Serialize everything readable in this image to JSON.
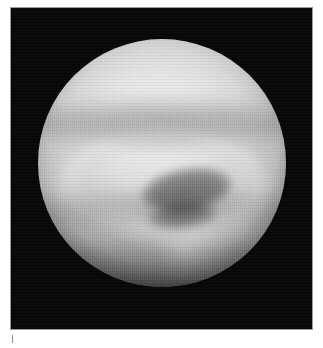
{
  "figure": {
    "name": "planetary-disc-photographic-plate",
    "media_type": "grayscale-astronomical-photograph",
    "frame": {
      "border_color": "#9a9a9a",
      "background_color": "#050505"
    },
    "subject": {
      "label": "planetary disc",
      "disc_center_x": 162,
      "disc_center_y": 163,
      "disc_radius": 124,
      "features": [
        {
          "name": "bright-polar-cap",
          "position": "upper hemisphere"
        },
        {
          "name": "dark-band-upper",
          "position": "upper-middle latitude"
        },
        {
          "name": "dark-spot-primary",
          "position": "central",
          "shape": "ellipse"
        },
        {
          "name": "dark-spot-secondary",
          "position": "below central spot",
          "shape": "ellipse"
        },
        {
          "name": "bright-chevron",
          "position": "lower hemisphere",
          "shape": "v-shaped"
        },
        {
          "name": "south-shadow",
          "position": "bottom limb"
        }
      ],
      "texture": "vertical scan-line striping"
    }
  },
  "caption": {
    "text": "",
    "legible": false,
    "color": "#d2d2d2"
  }
}
